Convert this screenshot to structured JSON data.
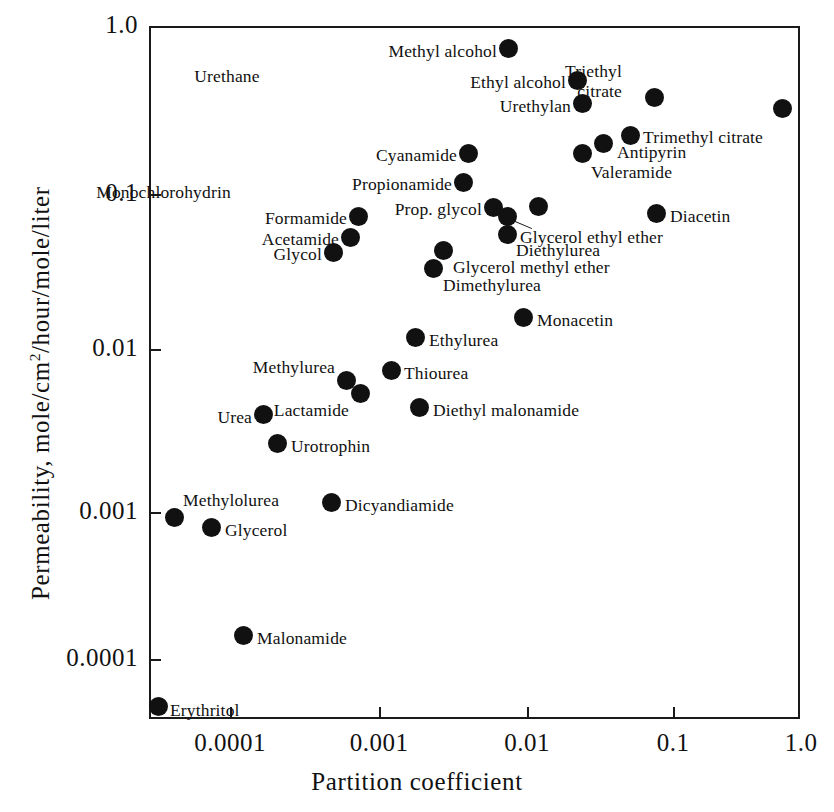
{
  "chart_data": {
    "type": "scatter",
    "title": "",
    "xlabel": "Partition  coefficient",
    "ylabel_prefix": "Permeability,  mole/cm",
    "ylabel_sup": "2",
    "ylabel_suffix": "/hour/mole/liter",
    "ylabel_full": "Permeability, mole/cm2/hour/mole/liter",
    "xscale": "log",
    "yscale": "log",
    "xlim": [
      3e-05,
      1.0
    ],
    "ylim": [
      3e-05,
      1.0
    ],
    "xticks": [
      "0.0001",
      "0.001",
      "0.01",
      "0.1",
      "1.0"
    ],
    "xtick_values": [
      0.0001,
      0.001,
      0.01,
      0.1,
      1.0
    ],
    "yticks": [
      "0.0001",
      "0.001",
      "0.01",
      "0.1",
      "1.0"
    ],
    "ytick_values": [
      0.0001,
      0.001,
      0.01,
      0.1,
      1.0
    ],
    "grid": false,
    "legend": "none",
    "marker": "filled-circle",
    "marker_color": "#111111",
    "points": [
      {
        "name": "Methyl alcohol",
        "x": 0.0075,
        "y": 0.86,
        "px": 508,
        "py": 48,
        "label_side": "left",
        "lx": 497,
        "ly": 41
      },
      {
        "name": "Ethyl alcohol",
        "x": 0.023,
        "y": 0.52,
        "px": 577,
        "py": 80,
        "label_side": "left",
        "lx": 566,
        "ly": 72
      },
      {
        "name": "Urethylan",
        "x": 0.024,
        "y": 0.36,
        "px": 582,
        "py": 103,
        "label_side": "left",
        "lx": 571,
        "ly": 96
      },
      {
        "name": "Urethane",
        "x": 0.054,
        "y": 0.4,
        "px": 654,
        "py": 97,
        "label_side": "above",
        "lx": 654,
        "ly": 66
      },
      {
        "name": "Triethyl citrate",
        "x": 0.62,
        "y": 0.35,
        "px": 782,
        "py": 108,
        "label_side": "above",
        "lx": 784,
        "ly": 61
      },
      {
        "name": "Trimethyl citrate",
        "x": 0.042,
        "y": 0.23,
        "px": 630,
        "py": 135,
        "label_side": "right",
        "lx": 643,
        "ly": 127
      },
      {
        "name": "Antipyrin",
        "x": 0.031,
        "y": 0.2,
        "px": 603,
        "py": 143,
        "label_side": "right",
        "lx": 617,
        "ly": 142
      },
      {
        "name": "Valeramide",
        "x": 0.0235,
        "y": 0.175,
        "px": 582,
        "py": 153,
        "label_side": "below",
        "lx": 591,
        "ly": 162
      },
      {
        "name": "Cyanamide",
        "x": 0.0041,
        "y": 0.175,
        "px": 468,
        "py": 153,
        "label_side": "left",
        "lx": 457,
        "ly": 145
      },
      {
        "name": "Propionamide",
        "x": 0.0038,
        "y": 0.125,
        "px": 463,
        "py": 182,
        "label_side": "left",
        "lx": 452,
        "ly": 174
      },
      {
        "name": "Monochlorohydrin",
        "x": 0.0118,
        "y": 0.091,
        "px": 538,
        "py": 206,
        "label_side": "above",
        "lx": 527,
        "ly": 182
      },
      {
        "name": "Prop. glycol",
        "x": 0.0067,
        "y": 0.089,
        "px": 493,
        "py": 207,
        "label_side": "left",
        "lx": 482,
        "ly": 199
      },
      {
        "name": "Diacetin",
        "x": 0.077,
        "y": 0.083,
        "px": 656,
        "py": 213,
        "label_side": "right",
        "lx": 670,
        "ly": 206
      },
      {
        "name": "Glycerol ethyl ether",
        "x": 0.0072,
        "y": 0.08,
        "px": 507,
        "py": 216,
        "label_side": "leader",
        "lx": 520,
        "ly": 227
      },
      {
        "name": "Formamide",
        "x": 0.00078,
        "y": 0.077,
        "px": 358,
        "py": 216,
        "label_side": "left",
        "lx": 347,
        "ly": 208
      },
      {
        "name": "Acetamide",
        "x": 0.00066,
        "y": 0.056,
        "px": 350,
        "py": 237,
        "label_side": "left",
        "lx": 339,
        "ly": 229
      },
      {
        "name": "Diethylurea",
        "x": 0.0073,
        "y": 0.063,
        "px": 507,
        "py": 234,
        "label_side": "below",
        "lx": 516,
        "ly": 240
      },
      {
        "name": "Glycol",
        "x": 0.00052,
        "y": 0.044,
        "px": 333,
        "py": 252,
        "label_side": "left",
        "lx": 322,
        "ly": 244
      },
      {
        "name": "Glycerol methyl ether",
        "x": 0.0028,
        "y": 0.046,
        "px": 443,
        "py": 250,
        "label_side": "right",
        "lx": 453,
        "ly": 257
      },
      {
        "name": "Dimethylurea",
        "x": 0.0025,
        "y": 0.035,
        "px": 433,
        "py": 268,
        "label_side": "below",
        "lx": 443,
        "ly": 275
      },
      {
        "name": "Monacetin",
        "x": 0.0099,
        "y": 0.0175,
        "px": 523,
        "py": 317,
        "label_side": "right",
        "lx": 537,
        "ly": 310
      },
      {
        "name": "Ethylurea",
        "x": 0.0019,
        "y": 0.0128,
        "px": 415,
        "py": 337,
        "label_side": "right",
        "lx": 429,
        "ly": 330
      },
      {
        "name": "Thiourea",
        "x": 0.0013,
        "y": 0.0079,
        "px": 391,
        "py": 370,
        "label_side": "right",
        "lx": 404,
        "ly": 363
      },
      {
        "name": "Methylurea",
        "x": 0.00063,
        "y": 0.0065,
        "px": 346,
        "py": 380,
        "label_side": "above-left",
        "lx": 335,
        "ly": 357
      },
      {
        "name": "Lactamide",
        "x": 0.00078,
        "y": 0.0055,
        "px": 360,
        "py": 393,
        "label_side": "below-left",
        "lx": 349,
        "ly": 400
      },
      {
        "name": "Diethyl malonamide",
        "x": 0.0019,
        "y": 0.0049,
        "px": 419,
        "py": 407,
        "label_side": "right",
        "lx": 433,
        "ly": 400
      },
      {
        "name": "Urea",
        "x": 0.00017,
        "y": 0.0043,
        "px": 263,
        "py": 414,
        "label_side": "left",
        "lx": 252,
        "ly": 407
      },
      {
        "name": "Urotrophin",
        "x": 0.00022,
        "y": 0.0027,
        "px": 277,
        "py": 443,
        "label_side": "right",
        "lx": 291,
        "ly": 436
      },
      {
        "name": "Dicyandiamide",
        "x": 0.00049,
        "y": 0.00113,
        "px": 331,
        "py": 502,
        "label_side": "right",
        "lx": 345,
        "ly": 495
      },
      {
        "name": "Methylolurea",
        "x": 5e-05,
        "y": 0.00086,
        "px": 174,
        "py": 517,
        "label_side": "above-right",
        "lx": 183,
        "ly": 490
      },
      {
        "name": "Glycerol",
        "x": 7e-05,
        "y": 0.00074,
        "px": 211,
        "py": 527,
        "label_side": "right",
        "lx": 225,
        "ly": 520
      },
      {
        "name": "Malonamide",
        "x": 0.00013,
        "y": 0.00015,
        "px": 243,
        "py": 635,
        "label_side": "right",
        "lx": 257,
        "ly": 628
      },
      {
        "name": "Erythritol",
        "x": 3.5e-05,
        "y": 5e-05,
        "px": 158,
        "py": 706,
        "label_side": "right",
        "lx": 170,
        "ly": 700
      }
    ]
  },
  "axes": {
    "x_title": "Partition  coefficient",
    "y_title_part1": "Permeability,  mole/cm",
    "y_title_sup": "2",
    "y_title_part2": "/hour/mole/liter"
  }
}
